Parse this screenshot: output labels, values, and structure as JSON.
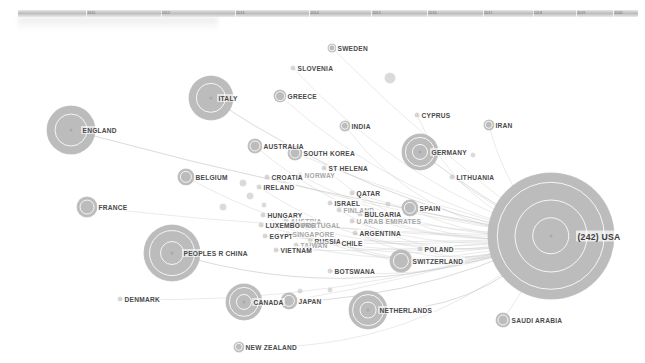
{
  "view": {
    "title": "Collaboration network graph",
    "background_color": "#ffffff",
    "node_color": "#bcbcbc",
    "edge_color": "#c9c9c9",
    "label_color": "#4a4a4a"
  },
  "timeline": {
    "name": "year-timeline-strip",
    "ticks": [
      {
        "pos": 11,
        "label": "2011"
      },
      {
        "pos": 23,
        "label": "2012"
      },
      {
        "pos": 35,
        "label": "2013"
      },
      {
        "pos": 47,
        "label": "2014"
      },
      {
        "pos": 57,
        "label": "2015"
      },
      {
        "pos": 66,
        "label": "2016"
      },
      {
        "pos": 75,
        "label": "2017"
      },
      {
        "pos": 83,
        "label": "2018"
      },
      {
        "pos": 90,
        "label": "2019"
      },
      {
        "pos": 96,
        "label": "2020"
      }
    ]
  },
  "graph": {
    "type": "force-directed-network",
    "hub": "USA",
    "nodes": [
      {
        "id": "usa",
        "label": "(242) USA",
        "x": 551,
        "y": 236,
        "r": 63,
        "rings": 3,
        "label_dx": 15,
        "label_dy": 0,
        "size": "big"
      },
      {
        "id": "england",
        "label": "ENGLAND",
        "x": 71,
        "y": 130,
        "r": 24,
        "rings": 1,
        "label_dx": 0,
        "label_dy": 0
      },
      {
        "id": "italy",
        "label": "ITALY",
        "x": 211,
        "y": 98,
        "r": 22,
        "rings": 1,
        "label_dx": -4,
        "label_dy": 0
      },
      {
        "id": "peoples-r-china",
        "label": "PEOPLES R CHINA",
        "x": 172,
        "y": 253,
        "r": 28,
        "rings": 2,
        "label_dx": 0,
        "label_dy": 0
      },
      {
        "id": "germany",
        "label": "GERMANY",
        "x": 420,
        "y": 152,
        "r": 18,
        "rings": 2,
        "label_dx": 0,
        "label_dy": 0
      },
      {
        "id": "canada",
        "label": "CANADA",
        "x": 244,
        "y": 302,
        "r": 18,
        "rings": 2,
        "label_dx": -2,
        "label_dy": 0
      },
      {
        "id": "netherlands",
        "label": "NETHERLANDS",
        "x": 368,
        "y": 310,
        "r": 19,
        "rings": 2,
        "label_dx": 0,
        "label_dy": 0
      },
      {
        "id": "france",
        "label": "FRANCE",
        "x": 87,
        "y": 207,
        "r": 10,
        "rings": 1,
        "label_dx": 0,
        "label_dy": 0
      },
      {
        "id": "switzerland",
        "label": "SWITZERLAND",
        "x": 401,
        "y": 261,
        "r": 11,
        "rings": 1,
        "label_dx": 0,
        "label_dy": 0
      },
      {
        "id": "belgium",
        "label": "BELGIUM",
        "x": 186,
        "y": 177,
        "r": 8,
        "rings": 1,
        "label_dx": 0,
        "label_dy": 0
      },
      {
        "id": "japan",
        "label": "JAPAN",
        "x": 289,
        "y": 301,
        "r": 8,
        "rings": 1,
        "label_dx": 0,
        "label_dy": 0
      },
      {
        "id": "spain",
        "label": "SPAIN",
        "x": 410,
        "y": 208,
        "r": 8,
        "rings": 1,
        "label_dx": 0,
        "label_dy": 0
      },
      {
        "id": "australia",
        "label": "AUSTRALIA",
        "x": 255,
        "y": 146,
        "r": 7,
        "rings": 1,
        "label_dx": 0,
        "label_dy": 0
      },
      {
        "id": "south-korea",
        "label": "SOUTH KOREA",
        "x": 295,
        "y": 153,
        "r": 7,
        "rings": 1,
        "label_dx": 0,
        "label_dy": 0
      },
      {
        "id": "greece",
        "label": "GREECE",
        "x": 280,
        "y": 96,
        "r": 6,
        "rings": 1,
        "label_dx": 0,
        "label_dy": 0
      },
      {
        "id": "india",
        "label": "INDIA",
        "x": 345,
        "y": 126,
        "r": 5,
        "rings": 1,
        "label_dx": 0,
        "label_dy": 0
      },
      {
        "id": "sweden",
        "label": "SWEDEN",
        "x": 332,
        "y": 48,
        "r": 4,
        "rings": 1,
        "label_dx": 0,
        "label_dy": 0
      },
      {
        "id": "iran",
        "label": "IRAN",
        "x": 489,
        "y": 125,
        "r": 5,
        "rings": 1,
        "label_dx": 0,
        "label_dy": 0
      },
      {
        "id": "new-zealand",
        "label": "NEW ZEALAND",
        "x": 239,
        "y": 347,
        "r": 5,
        "rings": 1,
        "label_dx": 0,
        "label_dy": 0
      },
      {
        "id": "saudi-arabia",
        "label": "SAUDI ARABIA",
        "x": 503,
        "y": 320,
        "r": 7,
        "rings": 1,
        "label_dx": 0,
        "label_dy": 0
      },
      {
        "id": "slovenia",
        "label": "SLOVENIA",
        "x": 293,
        "y": 68,
        "r": 2,
        "rings": 0,
        "label_dx": 0,
        "label_dy": 0
      },
      {
        "id": "cyprus",
        "label": "CYPRUS",
        "x": 417,
        "y": 115,
        "r": 2,
        "rings": 0,
        "label_dx": 0,
        "label_dy": 0
      },
      {
        "id": "lithuania",
        "label": "LITHUANIA",
        "x": 452,
        "y": 177,
        "r": 2,
        "rings": 0,
        "label_dx": 0,
        "label_dy": 0
      },
      {
        "id": "denmark",
        "label": "DENMARK",
        "x": 120,
        "y": 299,
        "r": 2,
        "rings": 0,
        "label_dx": 0,
        "label_dy": 0
      },
      {
        "id": "ireland",
        "label": "IRELAND",
        "x": 259,
        "y": 187,
        "r": 2,
        "rings": 0,
        "label_dx": 0,
        "label_dy": 0
      },
      {
        "id": "croatia",
        "label": "CROATIA",
        "x": 267,
        "y": 177,
        "r": 2,
        "rings": 0,
        "label_dx": 0,
        "label_dy": 0
      },
      {
        "id": "norway",
        "label": "NORWAY",
        "x": 300,
        "y": 175,
        "r": 2,
        "rings": 0,
        "label_dx": 0,
        "label_dy": 0,
        "size": "faint"
      },
      {
        "id": "st-helena",
        "label": "ST HELENA",
        "x": 324,
        "y": 168,
        "r": 2,
        "rings": 0,
        "label_dx": 0,
        "label_dy": 0
      },
      {
        "id": "qatar",
        "label": "QATAR",
        "x": 352,
        "y": 193,
        "r": 2,
        "rings": 0,
        "label_dx": 0,
        "label_dy": 0
      },
      {
        "id": "israel",
        "label": "ISRAEL",
        "x": 330,
        "y": 203,
        "r": 2,
        "rings": 0,
        "label_dx": 0,
        "label_dy": 0
      },
      {
        "id": "finland",
        "label": "FINLAND",
        "x": 339,
        "y": 210,
        "r": 2,
        "rings": 0,
        "label_dx": 0,
        "label_dy": 0,
        "size": "faint"
      },
      {
        "id": "bulgaria",
        "label": "BULGARIA",
        "x": 360,
        "y": 214,
        "r": 2,
        "rings": 0,
        "label_dx": 0,
        "label_dy": 0
      },
      {
        "id": "u-arab-emirates",
        "label": "U ARAB EMIRATES",
        "x": 352,
        "y": 221,
        "r": 2,
        "rings": 0,
        "label_dx": 0,
        "label_dy": 0,
        "size": "faint"
      },
      {
        "id": "hungary",
        "label": "HUNGARY",
        "x": 263,
        "y": 215,
        "r": 2,
        "rings": 0,
        "label_dx": 0,
        "label_dy": 0
      },
      {
        "id": "austria",
        "label": "AUSTRIA",
        "x": 286,
        "y": 221,
        "r": 2,
        "rings": 0,
        "label_dx": 0,
        "label_dy": 0,
        "size": "faint"
      },
      {
        "id": "luxembourg",
        "label": "LUXEMBOURG",
        "x": 261,
        "y": 225,
        "r": 2,
        "rings": 0,
        "label_dx": 0,
        "label_dy": 0
      },
      {
        "id": "portugal",
        "label": "PORTUGAL",
        "x": 297,
        "y": 225,
        "r": 2,
        "rings": 0,
        "label_dx": 0,
        "label_dy": 0,
        "size": "faint"
      },
      {
        "id": "egypt",
        "label": "EGYPT",
        "x": 265,
        "y": 236,
        "r": 2,
        "rings": 0,
        "label_dx": 0,
        "label_dy": 0
      },
      {
        "id": "singapore",
        "label": "SINGAPORE",
        "x": 288,
        "y": 234,
        "r": 2,
        "rings": 0,
        "label_dx": 0,
        "label_dy": 0,
        "size": "faint"
      },
      {
        "id": "argentina",
        "label": "ARGENTINA",
        "x": 355,
        "y": 233,
        "r": 2,
        "rings": 0,
        "label_dx": 0,
        "label_dy": 0
      },
      {
        "id": "russia",
        "label": "RUSSIA",
        "x": 310,
        "y": 241,
        "r": 2,
        "rings": 0,
        "label_dx": 0,
        "label_dy": 0
      },
      {
        "id": "taiwan",
        "label": "TAIWAN",
        "x": 296,
        "y": 245,
        "r": 2,
        "rings": 0,
        "label_dx": 0,
        "label_dy": 0,
        "size": "faint"
      },
      {
        "id": "chile",
        "label": "CHILE",
        "x": 337,
        "y": 243,
        "r": 2,
        "rings": 0,
        "label_dx": 0,
        "label_dy": 0
      },
      {
        "id": "vietnam",
        "label": "VIETNAM",
        "x": 276,
        "y": 250,
        "r": 2,
        "rings": 0,
        "label_dx": 0,
        "label_dy": 0
      },
      {
        "id": "botswana",
        "label": "BOTSWANA",
        "x": 330,
        "y": 271,
        "r": 2,
        "rings": 0,
        "label_dx": 0,
        "label_dy": 0
      },
      {
        "id": "poland",
        "label": "POLAND",
        "x": 420,
        "y": 249,
        "r": 2,
        "rings": 0,
        "label_dx": 0,
        "label_dy": 0
      }
    ],
    "unlabeled_nodes": [
      {
        "x": 390,
        "y": 78,
        "r": 5
      },
      {
        "x": 243,
        "y": 183,
        "r": 3
      },
      {
        "x": 250,
        "y": 196,
        "r": 3
      },
      {
        "x": 223,
        "y": 207,
        "r": 3
      },
      {
        "x": 264,
        "y": 205,
        "r": 2
      },
      {
        "x": 330,
        "y": 290,
        "r": 2
      },
      {
        "x": 300,
        "y": 291,
        "r": 2
      },
      {
        "x": 388,
        "y": 204,
        "r": 2
      },
      {
        "x": 473,
        "y": 155,
        "r": 2
      }
    ],
    "edges_from_hub": [
      "england",
      "italy",
      "peoples-r-china",
      "germany",
      "canada",
      "netherlands",
      "france",
      "switzerland",
      "belgium",
      "japan",
      "spain",
      "australia",
      "south-korea",
      "greece",
      "india",
      "sweden",
      "iran",
      "new-zealand",
      "saudi-arabia",
      "slovenia",
      "cyprus",
      "lithuania",
      "denmark",
      "ireland",
      "croatia",
      "norway",
      "st-helena",
      "qatar",
      "israel",
      "finland",
      "bulgaria",
      "u-arab-emirates",
      "hungary",
      "austria",
      "luxembourg",
      "portugal",
      "egypt",
      "singapore",
      "argentina",
      "russia",
      "taiwan",
      "chile",
      "vietnam",
      "botswana",
      "poland"
    ]
  }
}
